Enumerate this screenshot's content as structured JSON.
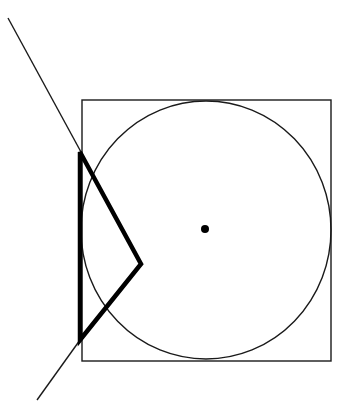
{
  "diagram": {
    "colors": {
      "background": "#ffffff",
      "stroke": "#1a1a1a",
      "thick_stroke": "#000000"
    },
    "square": {
      "x": 82,
      "y": 100,
      "width": 249,
      "height": 261
    },
    "circle": {
      "cx": 206,
      "cy": 230,
      "rx": 125,
      "ry": 129
    },
    "center_point": {
      "cx": 205,
      "cy": 229,
      "r": 4
    },
    "thick_shape": {
      "points": [
        [
          80,
          152
        ],
        [
          141,
          264
        ],
        [
          80,
          340
        ]
      ],
      "closed": true
    },
    "thin_lines": [
      {
        "x1": 8,
        "y1": 18,
        "x2": 81,
        "y2": 152
      },
      {
        "x1": 80,
        "y1": 340,
        "x2": 37,
        "y2": 400
      }
    ]
  }
}
